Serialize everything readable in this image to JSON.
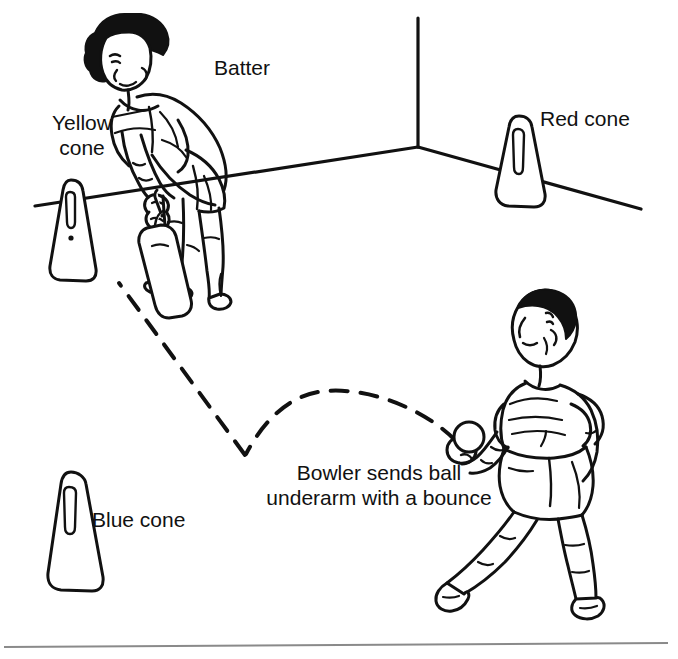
{
  "illustration": {
    "title": "Underarm cricket batting and bowling diagram",
    "stroke_color": "#111111",
    "background_color": "#ffffff",
    "rule_color": "#8a8a8a"
  },
  "labels": {
    "batter": "Batter",
    "yellow_cone": "Yellow\ncone",
    "yellow_cone_line1": "Yellow",
    "yellow_cone_line2": "cone",
    "red_cone": "Red cone",
    "blue_cone": "Blue cone",
    "bowler_caption": "Bowler sends ball\nunderarm with a bounce",
    "bowler_caption_line1": "Bowler sends ball",
    "bowler_caption_line2": "underarm with a bounce"
  },
  "figures": {
    "batter": "batter-figure",
    "bowler": "bowler-figure",
    "bat": "cricket-bat",
    "ball": "cricket-ball"
  },
  "cones": [
    {
      "name": "yellow-cone",
      "label": "Yellow cone",
      "color": "yellow"
    },
    {
      "name": "red-cone",
      "label": "Red cone",
      "color": "red"
    },
    {
      "name": "blue-cone",
      "label": "Blue cone",
      "color": "blue"
    }
  ],
  "trajectory": {
    "name": "ball-path",
    "style": "dashed",
    "description": "arc from bowler to bounce point then up to bat"
  }
}
